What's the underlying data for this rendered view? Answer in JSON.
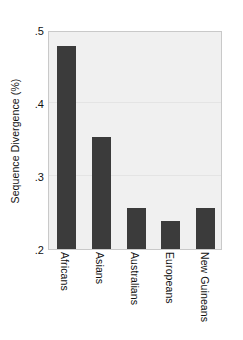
{
  "chart_data": {
    "type": "bar",
    "title": "",
    "xlabel": "",
    "ylabel": "Sequence Divergence (%)",
    "categories": [
      "Africans",
      "Asians",
      "Australians",
      "Europeans",
      "New Guineans"
    ],
    "values": [
      0.478,
      0.353,
      0.256,
      0.239,
      0.256
    ],
    "ylim": [
      0.2,
      0.5
    ],
    "yticks": [
      0.5,
      0.4,
      0.3,
      0.2
    ],
    "ytick_labels": [
      ".5",
      ".4",
      ".3",
      ".2"
    ],
    "grid": true,
    "legend": null,
    "bar_color": "#3b3b3b",
    "plot_background": "#f0f0f0",
    "frame_color": "#c9c9c9"
  }
}
